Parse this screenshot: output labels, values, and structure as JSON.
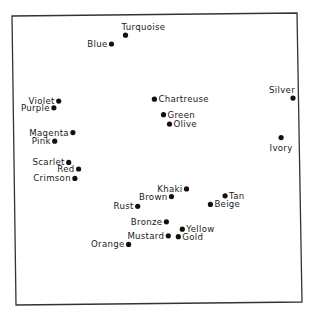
{
  "chart_data": {
    "type": "scatter",
    "title": "",
    "xlabel": "",
    "ylabel": "",
    "xlim": [
      0,
      100
    ],
    "ylim": [
      0,
      100
    ],
    "grid": false,
    "legend": "none",
    "axes_ticks": "none",
    "frame": true,
    "points": [
      {
        "label": "Turquoise",
        "x": 39.6,
        "y": 94.5,
        "label_pos": "above-right"
      },
      {
        "label": "Blue",
        "x": 34.7,
        "y": 91.3,
        "label_pos": "left"
      },
      {
        "label": "Violet",
        "x": 16.1,
        "y": 70.6,
        "label_pos": "left"
      },
      {
        "label": "Purple",
        "x": 14.4,
        "y": 68.2,
        "label_pos": "left"
      },
      {
        "label": "Chartreuse",
        "x": 49.8,
        "y": 71.3,
        "label_pos": "right"
      },
      {
        "label": "Silver",
        "x": 98.6,
        "y": 71.7,
        "label_pos": "above-left"
      },
      {
        "label": "Green",
        "x": 53.0,
        "y": 65.7,
        "label_pos": "right"
      },
      {
        "label": "Olive",
        "x": 55.1,
        "y": 62.3,
        "label_pos": "right"
      },
      {
        "label": "Ivory",
        "x": 94.4,
        "y": 57.4,
        "label_pos": "below"
      },
      {
        "label": "Magenta",
        "x": 21.1,
        "y": 59.2,
        "label_pos": "left"
      },
      {
        "label": "Pink",
        "x": 14.7,
        "y": 56.1,
        "label_pos": "left"
      },
      {
        "label": "Scarlet",
        "x": 19.6,
        "y": 48.4,
        "label_pos": "left"
      },
      {
        "label": "Red",
        "x": 23.1,
        "y": 46.0,
        "label_pos": "left"
      },
      {
        "label": "Crimson",
        "x": 21.8,
        "y": 42.6,
        "label_pos": "left"
      },
      {
        "label": "Khaki",
        "x": 61.1,
        "y": 38.8,
        "label_pos": "left"
      },
      {
        "label": "Brown",
        "x": 55.8,
        "y": 36.0,
        "label_pos": "left"
      },
      {
        "label": "Tan",
        "x": 74.7,
        "y": 36.3,
        "label_pos": "right"
      },
      {
        "label": "Rust",
        "x": 43.9,
        "y": 32.5,
        "label_pos": "left"
      },
      {
        "label": "Beige",
        "x": 69.5,
        "y": 33.2,
        "label_pos": "right"
      },
      {
        "label": "Bronze",
        "x": 54.0,
        "y": 26.9,
        "label_pos": "left"
      },
      {
        "label": "Yellow",
        "x": 59.6,
        "y": 24.2,
        "label_pos": "right"
      },
      {
        "label": "Mustard",
        "x": 54.7,
        "y": 21.8,
        "label_pos": "left"
      },
      {
        "label": "Gold",
        "x": 58.2,
        "y": 21.5,
        "label_pos": "right"
      },
      {
        "label": "Orange",
        "x": 40.7,
        "y": 18.7,
        "label_pos": "left"
      }
    ]
  }
}
